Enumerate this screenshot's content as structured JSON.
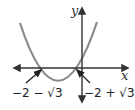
{
  "diagram": {
    "type": "function-graph",
    "function": "parabola opening upward",
    "axes": {
      "x_label": "x",
      "y_label": "y"
    },
    "roots": [
      {
        "label": "−2 − √3"
      },
      {
        "label": "−2 + √3"
      }
    ],
    "colors": {
      "curve": "#8a8a8a",
      "axes": "#333333",
      "text": "#222222"
    }
  }
}
